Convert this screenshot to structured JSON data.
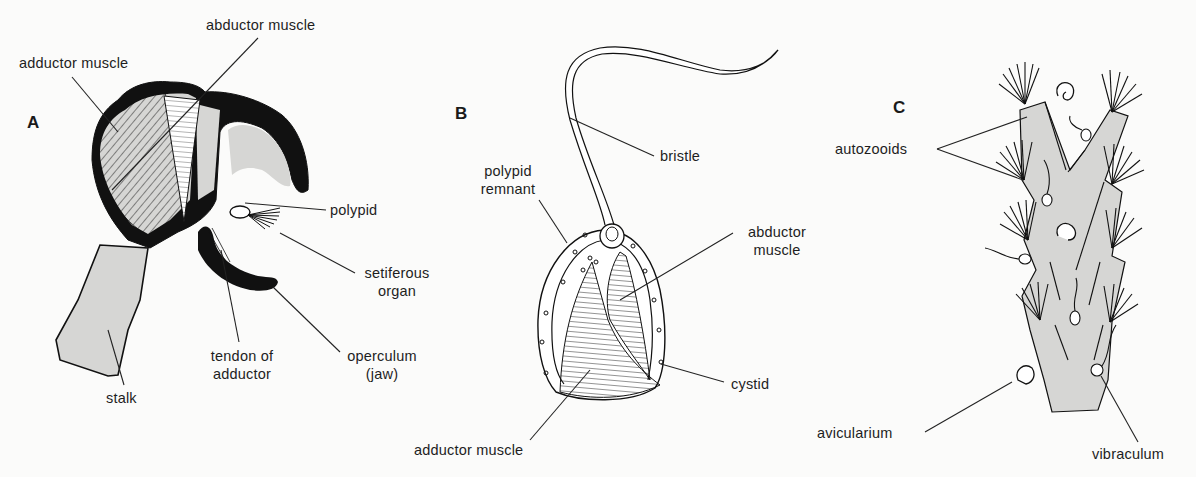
{
  "figure": {
    "panels": [
      {
        "id": "A",
        "letter": "A",
        "labels": {
          "abductor_muscle": "abductor muscle",
          "adductor_muscle": "adductor muscle",
          "polypid": "polypid",
          "setiferous_organ_1": "setiferous",
          "setiferous_organ_2": "organ",
          "operculum_1": "operculum",
          "operculum_2": "(jaw)",
          "tendon_1": "tendon of",
          "tendon_2": "adductor",
          "stalk": "stalk"
        }
      },
      {
        "id": "B",
        "letter": "B",
        "labels": {
          "bristle": "bristle",
          "polypid_remnant_1": "polypid",
          "polypid_remnant_2": "remnant",
          "abductor_muscle_1": "abductor",
          "abductor_muscle_2": "muscle",
          "cystid": "cystid",
          "adductor_muscle": "adductor muscle"
        }
      },
      {
        "id": "C",
        "letter": "C",
        "labels": {
          "autozooids": "autozooids",
          "avicularium": "avicularium",
          "vibraculum": "vibraculum"
        }
      }
    ],
    "colors": {
      "ink": "#111111",
      "fill_grey": "#d6d6d4",
      "background": "#fbfbfa"
    }
  }
}
